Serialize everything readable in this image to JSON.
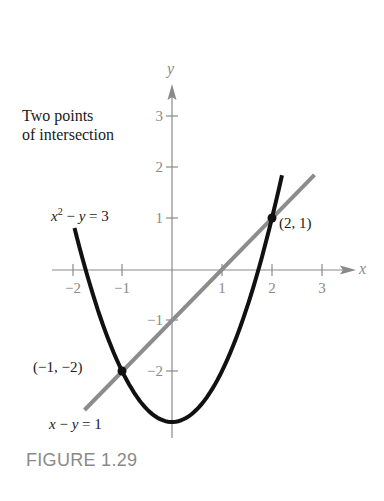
{
  "caption": "FIGURE 1.29",
  "annotation": {
    "line1": "Two points",
    "line2": "of intersection"
  },
  "labels": {
    "parabola_eq": {
      "var_x": "x",
      "exp": "2",
      "rest": " − ",
      "var_y": "y",
      "tail": " = 3"
    },
    "line_eq": {
      "var_x": "x",
      "mid": " − ",
      "var_y": "y",
      "tail": " = 1"
    },
    "point_a": "(2, 1)",
    "point_b": "(−1, −2)",
    "x_axis": "x",
    "y_axis": "y"
  },
  "chart_data": {
    "type": "line",
    "title": "FIGURE 1.29",
    "annotation": "Two points of intersection",
    "xlabel": "x",
    "ylabel": "y",
    "xlim": [
      -2.4,
      3.7
    ],
    "ylim": [
      -3.3,
      3.6
    ],
    "x_ticks": [
      -2,
      -1,
      1,
      2,
      3
    ],
    "x_tick_labels": [
      "−2",
      "−1",
      "1",
      "2",
      "3"
    ],
    "y_ticks": [
      3,
      2,
      1,
      -1,
      -2
    ],
    "y_tick_labels": [
      "3",
      "2",
      "1",
      "−1",
      "−2"
    ],
    "grid": false,
    "series": [
      {
        "name": "x^2 − y = 3",
        "equation": "y = x^2 − 3",
        "x_range": [
          -1.95,
          2.2
        ],
        "color": "#111111",
        "style": "solid-thick"
      },
      {
        "name": "x − y = 1",
        "equation": "y = x − 1",
        "x_range": [
          -1.75,
          2.85
        ],
        "color": "#8c8c8c",
        "style": "solid-thick"
      }
    ],
    "points": [
      {
        "label": "(2, 1)",
        "x": 2,
        "y": 1
      },
      {
        "label": "(−1, −2)",
        "x": -1,
        "y": -2
      }
    ]
  }
}
